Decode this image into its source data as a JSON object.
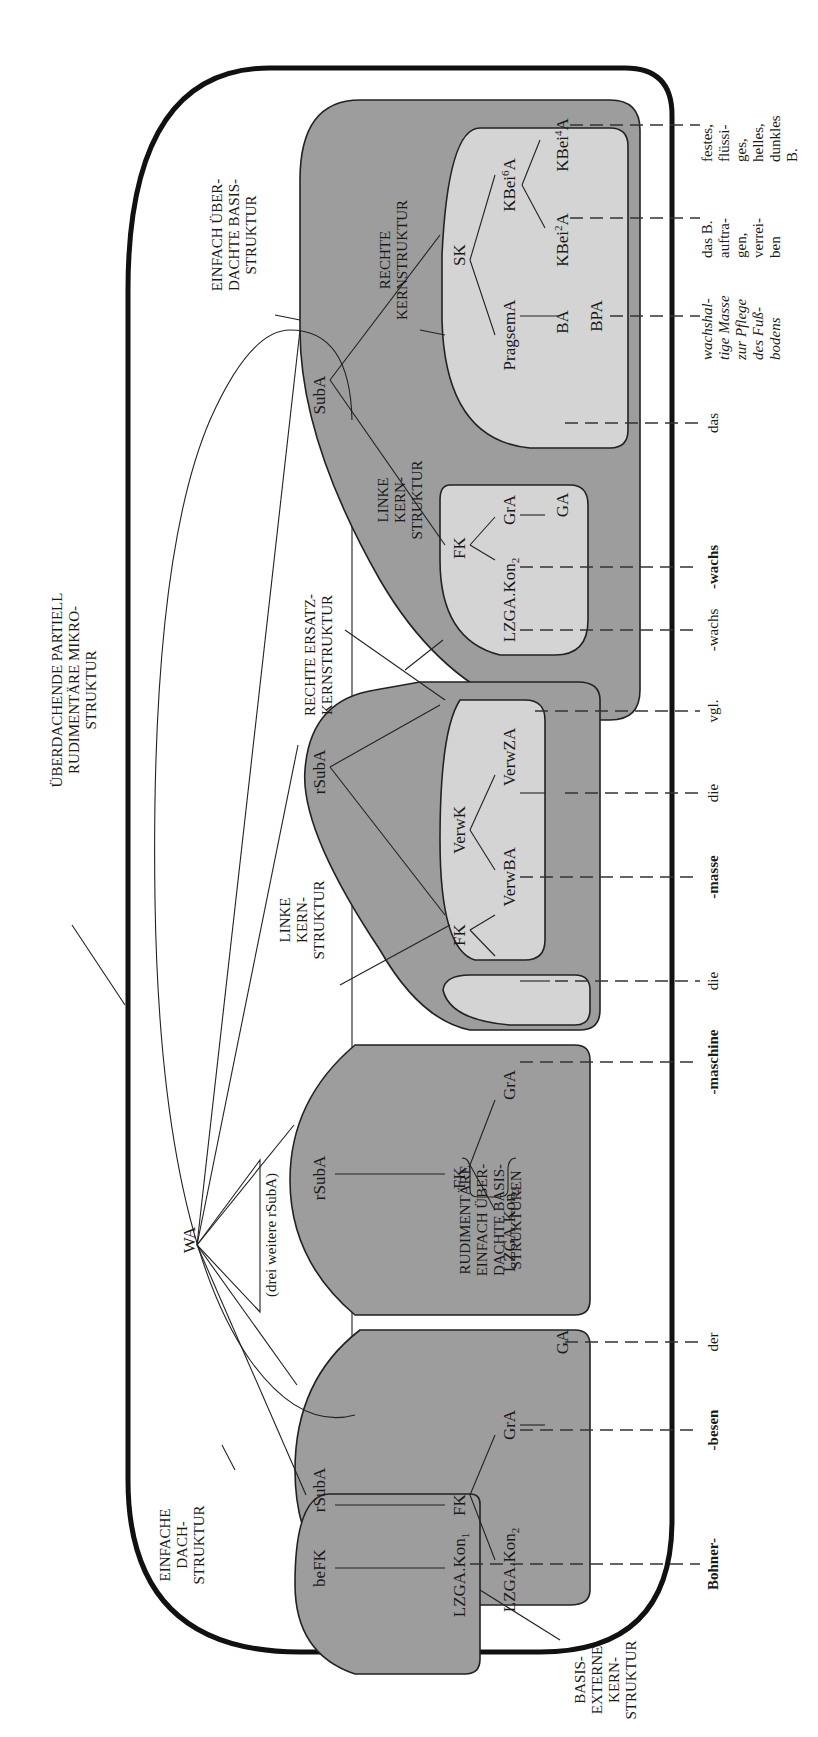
{
  "diagram": {
    "orientation": "rotated -90deg (reads bottom-to-top)",
    "labels": {
      "ueberdachende": [
        "ÜBERDACHENDE PARTIELL",
        "RUDIMENTÄRE MIKRO-",
        "STRUKTUR"
      ],
      "einfach_ueberdachte": [
        "EINFACH ÜBER-",
        "DACHTE BASIS-",
        "STRUKTUR"
      ],
      "rechte_kern": [
        "RECHTE",
        "KERNSTRUKTUR"
      ],
      "linke_kern_top": [
        "LINKE",
        "KERN-",
        "STRUKTUR"
      ],
      "rechte_ersatz": [
        "RECHTE ERSATZ-",
        "KERNSTRUKTUR"
      ],
      "linke_kern_mid": [
        "LINKE",
        "KERN-",
        "STRUKTUR"
      ],
      "rudimentaere": [
        "RUDIMENTÄRE",
        "EINFACH ÜBER-",
        "DACHTE BASIS-",
        "STRUKTUREN"
      ],
      "einfache_dach": [
        "EINFACHE",
        "DACH-",
        "STRUKTUR"
      ],
      "basis_externe": [
        "BASIS-",
        "EXTERNE",
        "KERN-",
        "STRUKTUR"
      ],
      "drei_weitere": "(drei weitere rSubA)"
    },
    "nodes": {
      "WA": "WA",
      "SubA": "SubA",
      "rSubA": "rSubA",
      "beFK": "beFK",
      "FK": "FK",
      "SK": "SK",
      "GrA": "GrA",
      "GA": "GA",
      "LZGA_Kon1": "LZGA.Kon",
      "LZGA_Kon2": "LZGA.Kon",
      "sub1": "1",
      "sub2": "2",
      "VerwK": "VerwK",
      "VerwBA": "VerwBA",
      "VerwZA": "VerwZA",
      "PragsemA": "PragsemA",
      "BA": "BA",
      "BPA": "BPA",
      "KBei6A": "KBei",
      "KBei2A": "KBei",
      "KBei4A": "KBei",
      "sup6": "6",
      "sup2": "2",
      "sup4": "4",
      "A": "A"
    },
    "words": {
      "bohner": "Bohner-",
      "besen": "-besen",
      "der": "der",
      "maschine": "-maschine",
      "die1": "die",
      "masse": "-masse",
      "die2": "die",
      "vgl": "vgl.",
      "wachs_plain": "-wachs",
      "wachs_bold": "-wachs",
      "das": "das",
      "def1": [
        "wachshal-",
        "tige Masse",
        "zur Pflege",
        "des Fuß-",
        "bodens"
      ],
      "def2": [
        "das B.",
        "auftra-",
        "gen,",
        "verrei-",
        "ben"
      ],
      "def3": [
        "festes,",
        "flüssi-",
        "ges,",
        "helles,",
        "dunkles",
        "B."
      ]
    },
    "colors": {
      "dark_fill": "#9d9d9d",
      "light_fill": "#d4d4d4",
      "line": "#222222"
    }
  }
}
